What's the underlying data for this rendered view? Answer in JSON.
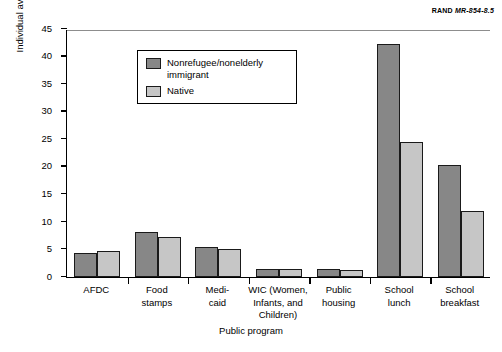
{
  "credit": {
    "organization": "RAND",
    "document_id": "MR-854-8.5"
  },
  "chart_data": {
    "type": "bar",
    "title": "",
    "xlabel": "Public program",
    "ylabel": "Individual average monthly probability of receiving benefits, 1990–93 (percent)",
    "ylim": [
      0,
      45
    ],
    "yticks": [
      0,
      5,
      10,
      15,
      20,
      25,
      30,
      35,
      40,
      45
    ],
    "ytick_labels": [
      "0",
      "5",
      "10",
      "15",
      "20",
      "25",
      "30",
      "35",
      "40",
      "45"
    ],
    "grid": false,
    "legend_position": "upper-left-inside",
    "categories": [
      "AFDC",
      "Food stamps",
      "Medi-caid",
      "WIC (Women, Infants, and Children)",
      "Public housing",
      "School lunch",
      "School breakfast"
    ],
    "category_label_lines": [
      [
        "AFDC"
      ],
      [
        "Food",
        "stamps"
      ],
      [
        "Medi-",
        "caid"
      ],
      [
        "WIC (Women,",
        "Infants, and",
        "Children)"
      ],
      [
        "Public",
        "housing"
      ],
      [
        "School",
        "lunch"
      ],
      [
        "School",
        "breakfast"
      ]
    ],
    "series": [
      {
        "name": "Nonrefugee/nonelderly immigrant",
        "legend_lines": [
          "Nonrefugee/nonelderly",
          "immigrant"
        ],
        "color": "#878787",
        "values": [
          4.3,
          8.2,
          5.5,
          1.5,
          1.5,
          42.2,
          20.3
        ]
      },
      {
        "name": "Native",
        "legend_lines": [
          "Native"
        ],
        "color": "#c6c6c6",
        "values": [
          4.7,
          7.3,
          5.0,
          1.5,
          1.2,
          24.5,
          12.0
        ]
      }
    ]
  }
}
